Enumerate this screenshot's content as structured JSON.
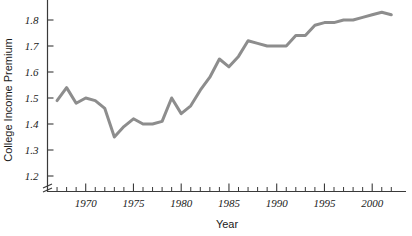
{
  "chart_data": {
    "type": "line",
    "title": "",
    "xlabel": "Year",
    "ylabel": "College Income Premium",
    "xlim": [
      1966,
      2002.5
    ],
    "ylim": [
      1.2,
      1.85
    ],
    "grid": false,
    "legend": "none",
    "line_color": "#8d8d8d",
    "axis_color": "#3a3a3a",
    "y_ticks": [
      1.2,
      1.3,
      1.4,
      1.5,
      1.6,
      1.7,
      1.8
    ],
    "y_tick_labels": [
      "1.2",
      "1.3",
      "1.4",
      "1.5",
      "1.6",
      "1.7",
      "1.8"
    ],
    "y_axis_break": true,
    "x_major_ticks": [
      1970,
      1975,
      1980,
      1985,
      1990,
      1995,
      2000
    ],
    "x_tick_labels": [
      "1970",
      "1975",
      "1980",
      "1985",
      "1990",
      "1995",
      "2000"
    ],
    "x_minor_tick_step": 1,
    "x": [
      1967,
      1968,
      1969,
      1970,
      1971,
      1972,
      1973,
      1974,
      1975,
      1976,
      1977,
      1978,
      1979,
      1980,
      1981,
      1982,
      1983,
      1984,
      1985,
      1986,
      1987,
      1988,
      1989,
      1990,
      1991,
      1992,
      1993,
      1994,
      1995,
      1996,
      1997,
      1998,
      1999,
      2000,
      2001,
      2002
    ],
    "values": [
      1.49,
      1.54,
      1.48,
      1.5,
      1.49,
      1.46,
      1.35,
      1.39,
      1.42,
      1.4,
      1.4,
      1.41,
      1.5,
      1.44,
      1.47,
      1.53,
      1.58,
      1.65,
      1.62,
      1.66,
      1.72,
      1.71,
      1.7,
      1.7,
      1.7,
      1.74,
      1.74,
      1.78,
      1.79,
      1.79,
      1.8,
      1.8,
      1.81,
      1.82,
      1.83,
      1.82
    ]
  },
  "axes": {
    "y_label": "College Income Premium",
    "x_label": "Year"
  }
}
